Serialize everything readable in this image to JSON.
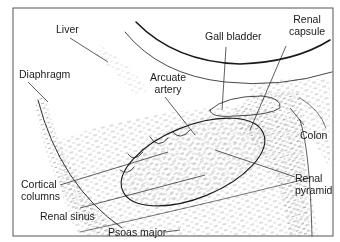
{
  "figure": {
    "type": "anatomical-ultrasound-diagram",
    "colors": {
      "line": "#1a1a1a",
      "stipple": "#8a8a8a",
      "frame": "#555555",
      "background": "#ffffff"
    }
  },
  "labels": {
    "liver": "Liver",
    "gall_bladder": "Gall bladder",
    "renal_capsule_1": "Renal",
    "renal_capsule_2": "capsule",
    "diaphragm": "Diaphragm",
    "arcuate_1": "Arcuate",
    "arcuate_2": "artery",
    "colon": "Colon",
    "cortical_1": "Cortical",
    "cortical_2": "columns",
    "renal_pyramid_1": "Renal",
    "renal_pyramid_2": "pyramid",
    "renal_sinus": "Renal sinus",
    "psoas_major": "Psoas major"
  }
}
